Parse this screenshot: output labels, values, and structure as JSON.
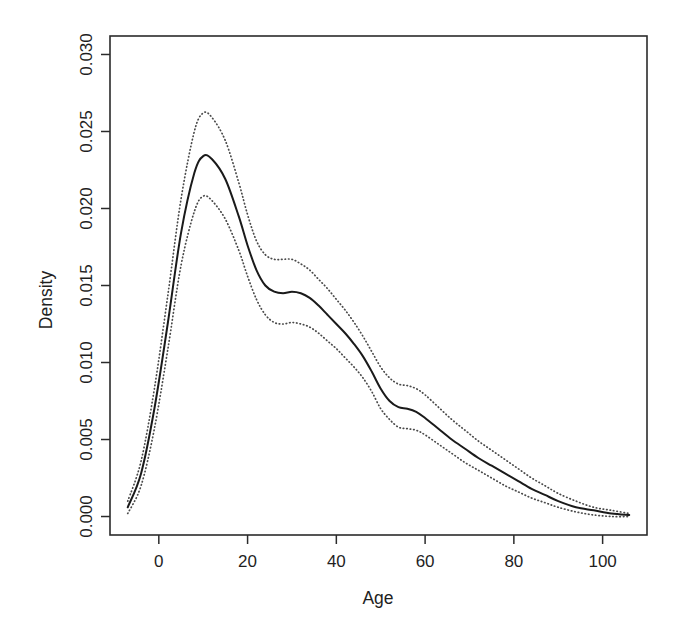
{
  "chart_data": {
    "type": "line",
    "title": "",
    "subtitle": "",
    "xlabel": "Age",
    "ylabel": "Density",
    "xlim": [
      -11,
      110
    ],
    "ylim": [
      -0.0012,
      0.0312
    ],
    "grid": false,
    "legend": "none",
    "x_ticks": [
      "0",
      "20",
      "40",
      "60",
      "80",
      "100"
    ],
    "x_tick_values": [
      0,
      20,
      40,
      60,
      80,
      100
    ],
    "y_ticks": [
      "0.000",
      "0.005",
      "0.010",
      "0.015",
      "0.020",
      "0.025",
      "0.030"
    ],
    "y_tick_values": [
      0.0,
      0.005,
      0.01,
      0.015,
      0.02,
      0.025,
      0.03
    ],
    "x": [
      -7,
      -4,
      -1,
      2,
      5,
      8,
      10,
      12,
      15,
      18,
      20,
      22,
      24,
      26,
      28,
      30,
      32,
      34,
      36,
      38,
      40,
      42,
      44,
      46,
      48,
      50,
      52,
      54,
      56,
      58,
      60,
      63,
      66,
      69,
      72,
      75,
      78,
      81,
      84,
      87,
      90,
      94,
      98,
      102,
      106
    ],
    "series": [
      {
        "name": "Density estimate",
        "style": "solid",
        "values": [
          0.0006,
          0.0028,
          0.007,
          0.0125,
          0.0184,
          0.0223,
          0.0234,
          0.0232,
          0.0219,
          0.0195,
          0.0176,
          0.016,
          0.015,
          0.0146,
          0.0145,
          0.0146,
          0.0145,
          0.0142,
          0.0137,
          0.0131,
          0.0125,
          0.0119,
          0.0112,
          0.0104,
          0.0094,
          0.0083,
          0.0075,
          0.0071,
          0.007,
          0.0068,
          0.0064,
          0.0057,
          0.005,
          0.0044,
          0.0038,
          0.0033,
          0.0028,
          0.0023,
          0.0018,
          0.0014,
          0.001,
          0.0006,
          0.0004,
          0.0002,
          0.0001
        ]
      },
      {
        "name": "Upper confidence band",
        "style": "dotted",
        "values": [
          0.001,
          0.0036,
          0.0083,
          0.0143,
          0.0206,
          0.025,
          0.0262,
          0.0259,
          0.0244,
          0.0217,
          0.0196,
          0.0179,
          0.017,
          0.0167,
          0.0167,
          0.0167,
          0.0164,
          0.016,
          0.0154,
          0.0148,
          0.0141,
          0.0134,
          0.0126,
          0.0117,
          0.0107,
          0.0097,
          0.009,
          0.0086,
          0.0085,
          0.0083,
          0.0079,
          0.0071,
          0.0063,
          0.0056,
          0.0049,
          0.0043,
          0.0037,
          0.0031,
          0.0025,
          0.002,
          0.0015,
          0.001,
          0.0006,
          0.0004,
          0.0002
        ]
      },
      {
        "name": "Lower confidence band",
        "style": "dotted",
        "values": [
          0.0002,
          0.002,
          0.0057,
          0.0108,
          0.0163,
          0.0198,
          0.0208,
          0.0205,
          0.0193,
          0.0173,
          0.0156,
          0.0141,
          0.0131,
          0.0126,
          0.0125,
          0.0126,
          0.0125,
          0.0123,
          0.0119,
          0.0114,
          0.0109,
          0.0103,
          0.0097,
          0.009,
          0.0081,
          0.007,
          0.0063,
          0.0058,
          0.0057,
          0.0056,
          0.0053,
          0.0047,
          0.0041,
          0.0035,
          0.003,
          0.0025,
          0.002,
          0.0016,
          0.0012,
          0.0009,
          0.0006,
          0.0003,
          0.0001,
          0.0,
          0.0
        ]
      }
    ],
    "annotations": [],
    "colors": {
      "curve": "#1a1a1a",
      "band": "#4a4a4a",
      "axis": "#2b2b2b",
      "background": "#ffffff"
    }
  }
}
